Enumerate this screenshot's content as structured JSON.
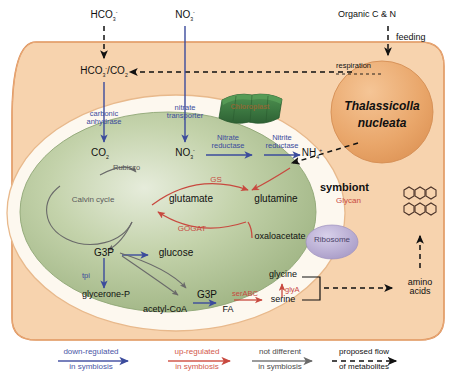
{
  "figure": {
    "type": "metabolic-pathway-diagram",
    "host": "Thalassicolla nucleata",
    "symbiont_label": "symbiont",
    "organelle_label": "Chloroplast"
  },
  "external_inputs": [
    {
      "id": "bicarbonate_in",
      "label": "HCO",
      "sub": "3",
      "sup": "-"
    },
    {
      "id": "nitrate_in",
      "label": "NO",
      "sub": "3",
      "sup": "-"
    },
    {
      "id": "organic",
      "label": "Organic C & N"
    }
  ],
  "host": {
    "name_line1": "Thalassicolla",
    "name_line2": "nucleata",
    "feeding": "feeding",
    "respiration": "respiration",
    "pool": {
      "a": "HCO",
      "a_sub": "3",
      "a_sup": "-",
      "slash": "/",
      "b": "CO",
      "b_sub": "2"
    },
    "amino_line1": "amino",
    "amino_line2": "acids",
    "glycan": "Glycan"
  },
  "symbiont": {
    "label": "symbiont",
    "ribosome": "Ribosome",
    "chloroplast": "Chloroplast",
    "enzymes": {
      "carbonic_anhydrase_l1": "carbonic",
      "carbonic_anhydrase_l2": "anhydrase",
      "nitrate_transporter_l1": "nitrate",
      "nitrate_transporter_l2": "transporter",
      "nitrate_reductase_l1": "Nitrate",
      "nitrate_reductase_l2": "reductase",
      "nitrite_reductase_l1": "Nitrite",
      "nitrite_reductase_l2": "reductase",
      "rubisco": "Rubisco",
      "gs": "GS",
      "gogat": "GOGAT",
      "tpi": "tpi",
      "serabc": "serABC",
      "glya": "glyA"
    },
    "metabolites": {
      "co2": "CO",
      "co2_sub": "2",
      "no3": "NO",
      "no3_sub": "3",
      "no3_sup": "-",
      "nh4": "NH",
      "nh4_sub": "4",
      "nh4_sup": "+",
      "calvin": "Calvin cycle",
      "glutamate": "glutamate",
      "glutamine": "glutamine",
      "oxaloacetate": "oxaloacetate",
      "g3p_upper": "G3P",
      "g3p_lower": "G3P",
      "glucose": "glucose",
      "glycerone_p": "glycerone-P",
      "acetyl_coa": "acetyl-CoA",
      "fa": "FA",
      "glycine": "glycine",
      "serine": "serine"
    }
  },
  "legend": [
    {
      "id": "down",
      "line1": "down-regulated",
      "line2": "in symbiosis",
      "color": "#4a56a6",
      "style": "solid"
    },
    {
      "id": "up",
      "line1": "up-regulated",
      "line2": "in symbiosis",
      "color": "#d2594c",
      "style": "solid"
    },
    {
      "id": "same",
      "line1": "not different",
      "line2": "in symbiosis",
      "color": "#7a7a7a",
      "style": "solid"
    },
    {
      "id": "flow",
      "line1": "proposed flow",
      "line2": "of metabolites",
      "color": "#111111",
      "style": "dashed"
    }
  ],
  "colors": {
    "host_fill": "#f7d3ae",
    "host_stroke": "#d98a52",
    "nucleus_fill": "#e9a66a",
    "symbiont_fill": "#fdf8ef",
    "chloroplast_fill": "#a9bd8e",
    "thylakoid": "#3d7a42",
    "ribosome": "#b9aed4",
    "blue": "#3b4b9c",
    "red": "#c8493f",
    "gray": "#6a6a6a"
  }
}
